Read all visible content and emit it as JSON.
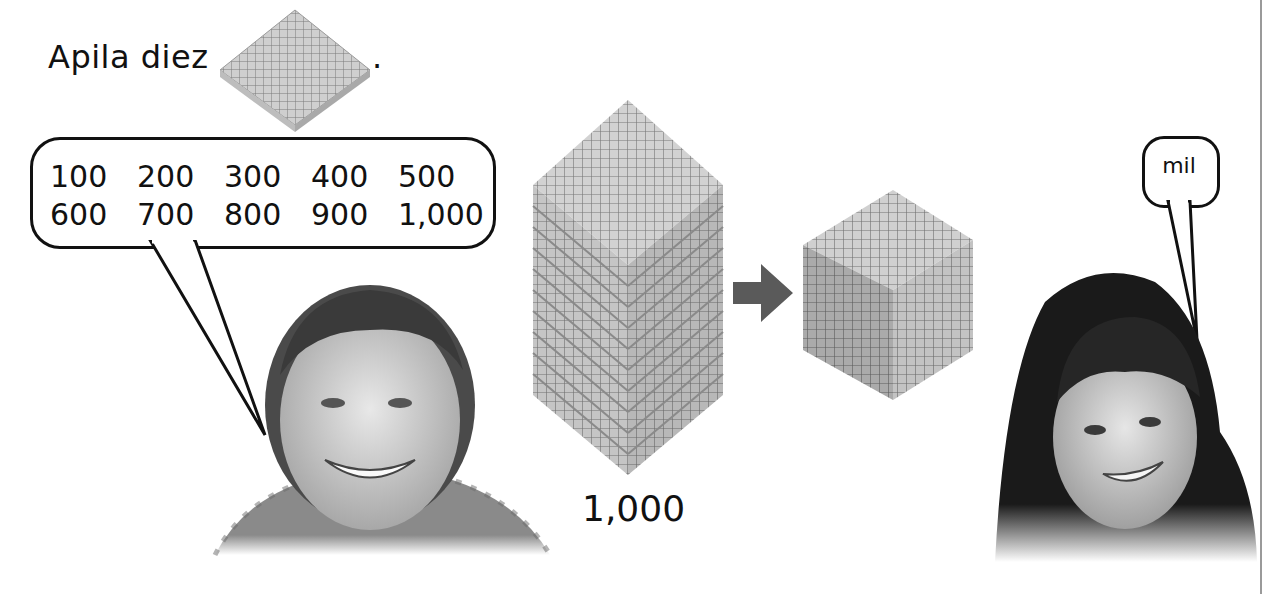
{
  "instruction": {
    "text": "Apila diez",
    "period": ".",
    "inline_icon": "hundreds-flat-icon"
  },
  "speech_left": {
    "numbers": [
      "100",
      "200",
      "300",
      "400",
      "500",
      "600",
      "700",
      "800",
      "900",
      "1,000"
    ]
  },
  "speech_right": {
    "text": "mil"
  },
  "stack": {
    "flats_count": 10,
    "caption": "1,000"
  },
  "arrow": {
    "icon": "right-arrow-icon",
    "color": "#5a5a5a"
  },
  "cube": {
    "icon": "thousand-cube-icon"
  },
  "people": [
    {
      "name": "boy-photo"
    },
    {
      "name": "girl-photo"
    }
  ]
}
